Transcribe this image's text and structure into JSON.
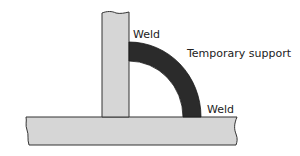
{
  "diagram": {
    "labels": {
      "weld_top": "Weld",
      "temporary_support": "Temporary support",
      "weld_bottom": "Weld"
    },
    "colors": {
      "plate_fill": "#d6d6d6",
      "plate_stroke": "#333333",
      "support_fill": "#2b2b2b",
      "background": "#ffffff"
    },
    "parts": [
      "vertical-plate",
      "base-plate",
      "temporary-support-arc"
    ]
  }
}
